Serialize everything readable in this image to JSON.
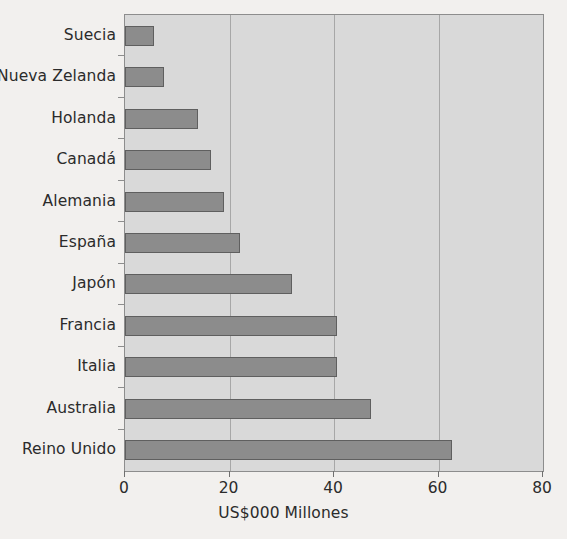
{
  "chart_data": {
    "type": "bar",
    "orientation": "horizontal",
    "title": "",
    "xlabel": "US$000 Millones",
    "ylabel": "",
    "xlim": [
      0,
      80
    ],
    "xticks": [
      "0",
      "20",
      "40",
      "60",
      "80"
    ],
    "xtick_values": [
      0,
      20,
      40,
      60,
      80
    ],
    "grid": true,
    "legend": "none",
    "categories": [
      "Suecia",
      "Nueva Zelanda",
      "Holanda",
      "Canadá",
      "Alemania",
      "España",
      "Japón",
      "Francia",
      "Italia",
      "Australia",
      "Reino Unido"
    ],
    "values": [
      5.5,
      7.5,
      14,
      16.5,
      19,
      22,
      32,
      40.5,
      40.5,
      47,
      62.5
    ],
    "bar_color": "#8c8c8c",
    "bar_border_color": "#5f5f5f",
    "plot_background": "#d9d9d9",
    "page_background": "#f2f0ee",
    "text_color": "#2b2b2b",
    "gridline_color": "#a7a7a7"
  }
}
